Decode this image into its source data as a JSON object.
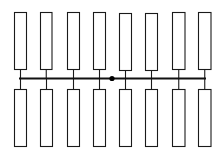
{
  "diagram": {
    "type": "ladder-bus",
    "colors": {
      "background": "#ffffff",
      "stroke": "#1a1a1a",
      "bus": "#111111",
      "node": "#000000"
    },
    "bus": {
      "x1": 19,
      "x2": 206,
      "y": 78.5
    },
    "node": {
      "cx": 112,
      "cy": 78.5,
      "r": 2.6
    },
    "top_row": {
      "y": 12,
      "height": 57,
      "cells": [
        {
          "x": 14,
          "w": 12
        },
        {
          "x": 40,
          "w": 11.5
        },
        {
          "x": 67,
          "w": 12
        },
        {
          "x": 93,
          "w": 12
        },
        {
          "x": 119,
          "w": 12,
          "y": 13
        },
        {
          "x": 145,
          "w": 12,
          "y": 13
        },
        {
          "x": 172,
          "w": 12.5
        },
        {
          "x": 198,
          "w": 12.5
        }
      ]
    },
    "bottom_row": {
      "y": 89,
      "height": 57,
      "cells": [
        {
          "x": 14,
          "w": 12
        },
        {
          "x": 40,
          "w": 12
        },
        {
          "x": 67,
          "w": 12
        },
        {
          "x": 93,
          "w": 12
        },
        {
          "x": 119,
          "w": 12
        },
        {
          "x": 145,
          "w": 12
        },
        {
          "x": 172,
          "w": 12.5
        },
        {
          "x": 198,
          "w": 12.5
        }
      ]
    }
  }
}
